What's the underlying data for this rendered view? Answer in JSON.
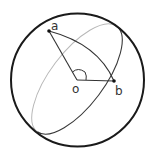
{
  "diagram": {
    "type": "sphere-geodesic",
    "colors": {
      "sphere_outline": "#1a1a1a",
      "front_arc": "#3a3a3a",
      "back_arc": "#b8b8b8",
      "lines": "#333333",
      "points": "#111111"
    },
    "sphere": {
      "cx": 77.5,
      "cy": 80,
      "r": 67
    },
    "great_circle": {
      "cx": 77,
      "cy": 79,
      "rx": 66,
      "ry": 27,
      "rotation_deg": -53
    },
    "points": [
      {
        "id": "a",
        "label": "a",
        "x": 49,
        "y": 31
      },
      {
        "id": "o",
        "label": "o",
        "x": 77,
        "y": 80
      },
      {
        "id": "b",
        "label": "b",
        "x": 114,
        "y": 81
      }
    ],
    "labels": {
      "a": "a",
      "o": "o",
      "b": "b"
    },
    "annotations": {
      "angle_mark": "angle aob (right-angle style arc at o)"
    }
  }
}
